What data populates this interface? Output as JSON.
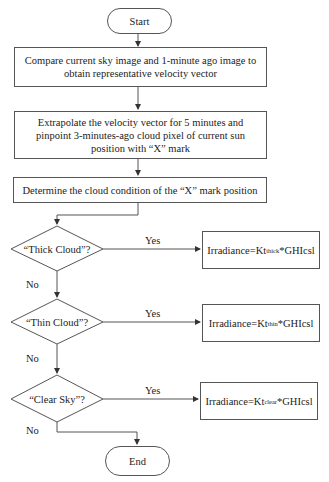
{
  "flowchart": {
    "start": "Start",
    "end": "End",
    "steps": [
      "Compare current sky image and 1-minute ago image to obtain representative velocity vector",
      "Extrapolate the velocity vector for 5 minutes and pinpoint 3-minutes-ago cloud pixel of current sun position with “X” mark",
      "Determine the cloud condition of the “X” mark position"
    ],
    "decisions": [
      {
        "question": "“Thick Cloud”?",
        "yes_label": "Yes",
        "no_label": "No",
        "outcome": {
          "prefix": "Irradiance=Kt",
          "subscript": "thick",
          "suffix": "*GHIcsl"
        }
      },
      {
        "question": "“Thin Cloud”?",
        "yes_label": "Yes",
        "no_label": "No",
        "outcome": {
          "prefix": "Irradiance=Kt",
          "subscript": "thin",
          "suffix": "*GHIcsl"
        }
      },
      {
        "question": "“Clear Sky”?",
        "yes_label": "Yes",
        "no_label": "No",
        "outcome": {
          "prefix": "Irradiance=Kt",
          "subscript": "clear",
          "suffix": "*GHIcsl"
        }
      }
    ]
  }
}
